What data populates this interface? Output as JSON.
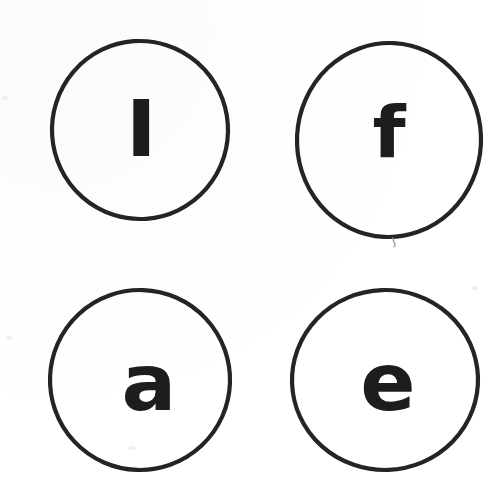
{
  "sheet": {
    "title": "Letter circles worksheet",
    "description": "Four hand-drawn circles on white paper, each containing one bold lowercase letter",
    "width": 501,
    "height": 478,
    "background_color": "#ffffff",
    "ink_color": "#242424",
    "glyph_color": "#1d1d1d"
  },
  "circles": [
    {
      "id": "circle-l",
      "letter": "l",
      "letter_name": "lowercase-l",
      "position": "top-left",
      "cx": 140,
      "cy": 130,
      "rx": 88,
      "ry": 89,
      "stroke_width": 4.2,
      "glyph_x": 140,
      "glyph_y": 139
    },
    {
      "id": "circle-f",
      "letter": "f",
      "letter_name": "lowercase-f",
      "position": "top-right",
      "cx": 389,
      "cy": 140,
      "rx": 92,
      "ry": 97,
      "stroke_width": 4.2,
      "glyph_x": 389,
      "glyph_y": 134
    },
    {
      "id": "circle-a",
      "letter": "a",
      "letter_name": "lowercase-a",
      "position": "bottom-left",
      "cx": 140,
      "cy": 380,
      "rx": 90,
      "ry": 90,
      "stroke_width": 4.2,
      "glyph_x": 148,
      "glyph_y": 385
    },
    {
      "id": "circle-e",
      "letter": "e",
      "letter_name": "lowercase-e",
      "position": "bottom-right",
      "cx": 385,
      "cy": 380,
      "rx": 93,
      "ry": 90,
      "stroke_width": 4.2,
      "glyph_x": 388,
      "glyph_y": 384
    }
  ],
  "marks": [
    {
      "id": "smudge-below-f",
      "label": "pencil smudge",
      "glyph": "J",
      "x": 392,
      "y": 238,
      "color": "#8d8d8d"
    }
  ],
  "flecks": [
    {
      "x": 2,
      "y": 96,
      "w": 7,
      "h": 4
    },
    {
      "x": 6,
      "y": 336,
      "w": 6,
      "h": 4
    },
    {
      "x": 472,
      "y": 286,
      "w": 6,
      "h": 4
    },
    {
      "x": 128,
      "y": 446,
      "w": 8,
      "h": 4
    }
  ]
}
